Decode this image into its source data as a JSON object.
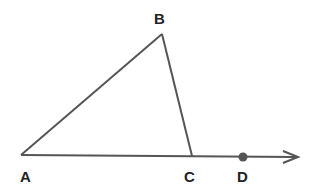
{
  "diagram": {
    "type": "geometry",
    "points": {
      "A": {
        "label": "A",
        "x": 21,
        "y": 155
      },
      "B": {
        "label": "B",
        "x": 162,
        "y": 34
      },
      "C": {
        "label": "C",
        "x": 192,
        "y": 156
      },
      "D": {
        "label": "D",
        "x": 243,
        "y": 157
      }
    },
    "segments": [
      [
        "A",
        "B"
      ],
      [
        "B",
        "C"
      ],
      [
        "A",
        "C"
      ]
    ],
    "ray": {
      "from": "A",
      "through": "D",
      "tip_x": 298,
      "tip_y": 157
    },
    "colors": {
      "line": "#555555",
      "point": "#555555",
      "label": "#222222"
    }
  }
}
